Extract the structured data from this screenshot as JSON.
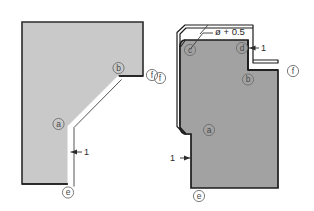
{
  "diagram": {
    "background_color": "#ffffff",
    "figures": [
      {
        "id": "left-figure",
        "name": "left-profile",
        "fill_color": "#c9c9c9",
        "outline_color": "#2b2b2b",
        "callouts": [
          {
            "key": "a",
            "label": "a"
          },
          {
            "key": "b",
            "label": "b"
          },
          {
            "key": "e",
            "label": "e"
          },
          {
            "key": "f",
            "label": "f"
          }
        ],
        "dimensions": [
          {
            "key": "thickness",
            "value": "1"
          }
        ]
      },
      {
        "id": "right-figure",
        "name": "right-profile",
        "fill_color": "#a2a2a2",
        "outline_color": "#1c1c1c",
        "callouts": [
          {
            "key": "a",
            "label": "a"
          },
          {
            "key": "b",
            "label": "b"
          },
          {
            "key": "c",
            "label": "c"
          },
          {
            "key": "d",
            "label": "d"
          },
          {
            "key": "e",
            "label": "e"
          },
          {
            "key": "f_left",
            "label": "f"
          },
          {
            "key": "f_right",
            "label": "f"
          }
        ],
        "dimensions": [
          {
            "key": "top_gap",
            "value": "1"
          },
          {
            "key": "bottom_thickness",
            "value": "1"
          }
        ],
        "notes": [
          {
            "key": "diameter_note",
            "text": "ø + 0.5"
          }
        ]
      }
    ]
  }
}
